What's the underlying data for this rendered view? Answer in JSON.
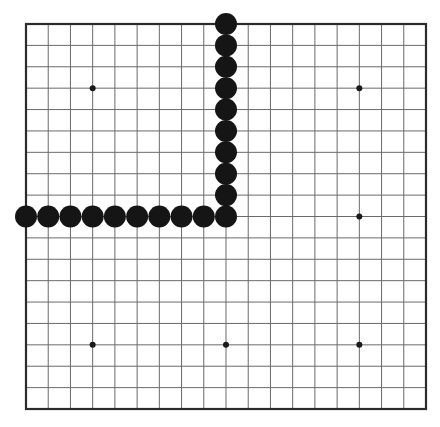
{
  "board": {
    "size": 19,
    "origin": {
      "x": 26,
      "y": 24
    },
    "end": {
      "x": 426,
      "y": 409
    },
    "background": "#ffffff",
    "grid_color": "#6a6a6a",
    "border_color": "#2b2b2b",
    "star_color": "#1a1a1a",
    "star_points": [
      [
        3,
        3
      ],
      [
        15,
        3
      ],
      [
        15,
        9
      ],
      [
        3,
        15
      ],
      [
        9,
        15
      ],
      [
        15,
        15
      ]
    ]
  },
  "stones": {
    "color": "#151515",
    "radius": 11,
    "black": [
      [
        0,
        9
      ],
      [
        1,
        9
      ],
      [
        2,
        9
      ],
      [
        3,
        9
      ],
      [
        4,
        9
      ],
      [
        5,
        9
      ],
      [
        6,
        9
      ],
      [
        7,
        9
      ],
      [
        8,
        9
      ],
      [
        9,
        9
      ],
      [
        9,
        0
      ],
      [
        9,
        1
      ],
      [
        9,
        2
      ],
      [
        9,
        3
      ],
      [
        9,
        4
      ],
      [
        9,
        5
      ],
      [
        9,
        6
      ],
      [
        9,
        7
      ],
      [
        9,
        8
      ]
    ]
  }
}
